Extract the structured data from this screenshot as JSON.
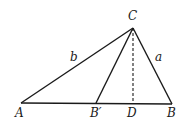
{
  "diagram": {
    "type": "triangle",
    "stroke_color": "#1a1a1a",
    "points": {
      "A": {
        "label": "A",
        "x": 21,
        "y": 103,
        "lx": 15,
        "ly": 117
      },
      "B_prime": {
        "label": "B′",
        "x": 96,
        "y": 103,
        "lx": 90,
        "ly": 117
      },
      "D": {
        "label": "D",
        "x": 133,
        "y": 103,
        "lx": 127,
        "ly": 117
      },
      "B": {
        "label": "B",
        "x": 172,
        "y": 104,
        "lx": 167,
        "ly": 117
      },
      "C": {
        "label": "C",
        "x": 133,
        "y": 28,
        "lx": 128,
        "ly": 20
      }
    },
    "sides": {
      "b": {
        "label": "b",
        "lx": 70,
        "ly": 61
      },
      "a": {
        "label": "a",
        "lx": 155,
        "ly": 61
      }
    },
    "segments": [
      {
        "from": "A",
        "to": "B",
        "style": "solid"
      },
      {
        "from": "A",
        "to": "C",
        "style": "solid"
      },
      {
        "from": "C",
        "to": "B",
        "style": "solid"
      },
      {
        "from": "C",
        "to": "B_prime",
        "style": "solid"
      },
      {
        "from": "C",
        "to": "D",
        "style": "dashed"
      }
    ]
  }
}
